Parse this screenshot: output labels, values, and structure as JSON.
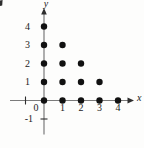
{
  "figure": {
    "background": "#fdfdfc"
  },
  "chart_data": {
    "type": "scatter",
    "title": "",
    "xlabel": "x",
    "ylabel": "y",
    "origin_label": "0",
    "points": [
      [
        0,
        0
      ],
      [
        1,
        0
      ],
      [
        2,
        0
      ],
      [
        3,
        0
      ],
      [
        4,
        0
      ],
      [
        0,
        1
      ],
      [
        1,
        1
      ],
      [
        2,
        1
      ],
      [
        3,
        1
      ],
      [
        0,
        2
      ],
      [
        1,
        2
      ],
      [
        2,
        2
      ],
      [
        0,
        3
      ],
      [
        1,
        3
      ],
      [
        0,
        4
      ]
    ],
    "x_ticks": [
      1,
      2,
      3,
      4
    ],
    "y_ticks": [
      1,
      2,
      3,
      4
    ],
    "x_unlabeled_tick": -1,
    "y_extra_tick_value": -1,
    "y_extra_tick_label": "-1",
    "xlim": [
      -1.9,
      4.9
    ],
    "ylim": [
      -1.9,
      5.0
    ],
    "grid": false,
    "legend": null,
    "colors": {
      "dot": "#111111",
      "axis": "#7b7b7b",
      "axis_dark": "#2e2e2e",
      "text": "#1b1b1b"
    }
  }
}
